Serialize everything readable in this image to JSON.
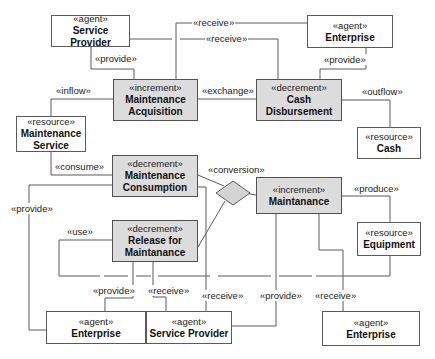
{
  "diagram": {
    "type": "REA value model",
    "nodes": {
      "sp_top": {
        "stereotype": "«agent»",
        "name": "Service Provider"
      },
      "ent_top": {
        "stereotype": "«agent»",
        "name": "Enterprise"
      },
      "maint_acq": {
        "stereotype": "«increment»",
        "name1": "Maintenance",
        "name2": "Acquisition"
      },
      "cash_disb": {
        "stereotype": "«decrement»",
        "name1": "Cash",
        "name2": "Disbursement"
      },
      "maint_service": {
        "stereotype": "«resource»",
        "name1": "Maintenance",
        "name2": "Service"
      },
      "cash": {
        "stereotype": "«resource»",
        "name": "Cash"
      },
      "maint_cons": {
        "stereotype": "«decrement»",
        "name1": "Maintenance",
        "name2": "Consumption"
      },
      "maintanance": {
        "stereotype": "«increment»",
        "name": "Maintanance"
      },
      "release": {
        "stereotype": "«decrement»",
        "name1": "Release for",
        "name2": "Maintanance"
      },
      "equipment": {
        "stereotype": "«resource»",
        "name": "Equipment"
      },
      "ent_bl": {
        "stereotype": "«agent»",
        "name": "Enterprise"
      },
      "sp_bottom": {
        "stereotype": "«agent»",
        "name": "Service Provider"
      },
      "ent_br": {
        "stereotype": "«agent»",
        "name": "Enterprise"
      }
    },
    "labels": {
      "receive1": "«receive»",
      "receive2": "«receive»",
      "provide_sp": "«provide»",
      "provide_ent": "«provide»",
      "inflow": "«inflow»",
      "exchange": "«exchange»",
      "outflow": "«outflow»",
      "consume": "«consume»",
      "conversion": "«conversion»",
      "produce": "«produce»",
      "provide_left": "«provide»",
      "use": "«use»",
      "provide_bl": "«provide»",
      "receive_bl": "«receive»",
      "receive_mid": "«receive»",
      "provide_mid": "«provide»",
      "receive_br": "«receive»"
    },
    "colors": {
      "shaded_fill": "#dcdcdc",
      "line": "#5a5a5a",
      "diamond_fill": "#d4d4d4"
    }
  }
}
